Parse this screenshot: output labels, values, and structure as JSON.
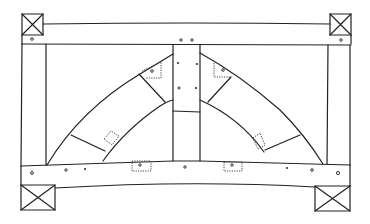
{
  "diagram": {
    "title": "",
    "colors": {
      "line": "#222222",
      "background": "#ffffff"
    },
    "components": [
      {
        "id": "top-beam",
        "label": ""
      },
      {
        "id": "bottom-beam",
        "label": ""
      },
      {
        "id": "left-post",
        "label": ""
      },
      {
        "id": "right-post",
        "label": ""
      },
      {
        "id": "king-post",
        "label": ""
      },
      {
        "id": "left-arch-brace",
        "label": ""
      },
      {
        "id": "right-arch-brace",
        "label": ""
      },
      {
        "id": "corner-post-top-left",
        "label": ""
      },
      {
        "id": "corner-post-top-right",
        "label": ""
      },
      {
        "id": "corner-post-bottom-left",
        "label": ""
      },
      {
        "id": "corner-post-bottom-right",
        "label": ""
      }
    ]
  }
}
